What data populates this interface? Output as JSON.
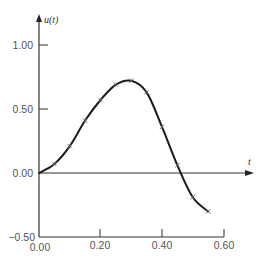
{
  "chart_data": {
    "type": "line",
    "title": "",
    "xlabel": "t",
    "ylabel": "u(t)",
    "xlim": [
      0.0,
      0.6
    ],
    "ylim": [
      -0.5,
      1.0
    ],
    "grid": false,
    "legend": null,
    "x_ticks": [
      "0.00",
      "0.20",
      "0.40",
      "0.60"
    ],
    "y_ticks": [
      "-0.50",
      "0.00",
      "0.50",
      "1.00"
    ],
    "series": [
      {
        "name": "u(t)",
        "style": "solid curve with x markers",
        "x": [
          0.0,
          0.05,
          0.1,
          0.15,
          0.2,
          0.25,
          0.3,
          0.35,
          0.4,
          0.45,
          0.5,
          0.55
        ],
        "values": [
          0.0,
          0.07,
          0.21,
          0.41,
          0.57,
          0.69,
          0.72,
          0.63,
          0.36,
          0.06,
          -0.19,
          -0.3
        ]
      }
    ]
  },
  "labels": {
    "y_axis": "u(t)",
    "x_axis": "t",
    "y_tick_1": "1.00",
    "y_tick_05": "0.50",
    "y_tick_0": "0.00",
    "y_tick_m05": "−0.50",
    "x_tick_0": "0.00",
    "x_tick_02": "0.20",
    "x_tick_04": "0.40",
    "x_tick_06": "0.60"
  },
  "colors": {
    "line": "#1a1a1a",
    "axis": "#333333",
    "text": "#555555"
  }
}
